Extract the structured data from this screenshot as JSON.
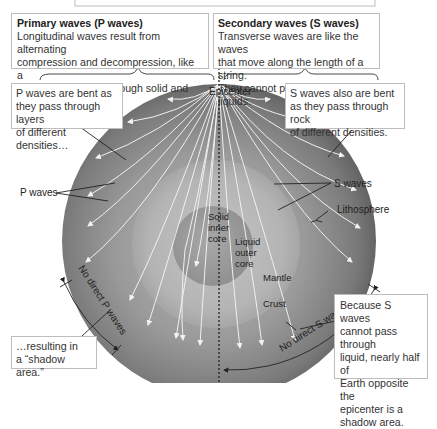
{
  "top_box": {
    "visible": true
  },
  "p_waves_box": {
    "title": "Primary waves (P waves)",
    "lines": [
      "Longitudinal waves result from alternating",
      "compression and decompression, like a",
      "spring. They travel through solid and liquid."
    ]
  },
  "s_waves_box": {
    "title": "Secondary waves (S waves)",
    "lines": [
      "Transverse waves are like the waves",
      "that move along the length of a string.",
      "They cannot pass through liquids."
    ]
  },
  "p_bent_box": {
    "lines": [
      "P waves are bent as",
      "they pass through layers",
      "of different densities…"
    ]
  },
  "s_bent_box": {
    "lines": [
      "S waves also are bent",
      "as they pass through rock",
      "of different densities."
    ]
  },
  "shadow_p_box": {
    "lines": [
      "…resulting in",
      "a “shadow area.”"
    ]
  },
  "shadow_s_box": {
    "lines": [
      "Because S waves",
      "cannot pass through",
      "liquid, nearly half of",
      "Earth opposite the",
      "epicenter is a",
      "shadow area."
    ]
  },
  "labels": {
    "epicenter": "Epicenter",
    "p_waves": "P waves",
    "s_waves": "S waves",
    "lithosphere": "Lithosphere",
    "inner_core": [
      "Solid",
      "inner",
      "core"
    ],
    "outer_core": [
      "Liquid",
      "outer",
      "core"
    ],
    "mantle": "Mantle",
    "crust": "Crust",
    "no_direct_p": "No direct P waves",
    "no_direct_s": "No direct S waves"
  },
  "colors": {
    "mantle_outer": "#6e6e6e",
    "mantle_inner": "#9a9a9a",
    "outer_core": "#b5b5b5",
    "inner_core": "#9e9e9e",
    "wave_line": "#f2f2f2",
    "box_border": "#bdbdbd"
  }
}
